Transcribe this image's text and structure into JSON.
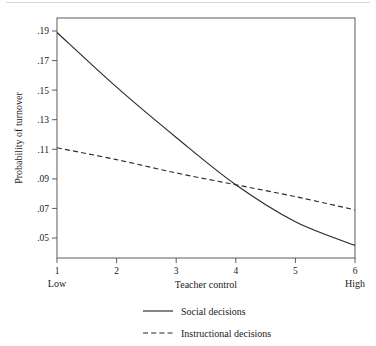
{
  "chart_data": {
    "type": "line",
    "title": "",
    "xlabel": "Teacher control",
    "ylabel": "Probability of turnover",
    "xlim": [
      1,
      6
    ],
    "ylim": [
      0.04,
      0.2
    ],
    "grid": false,
    "legend_position": "bottom",
    "x_ticks": [
      "1",
      "2",
      "3",
      "4",
      "5",
      "6"
    ],
    "x_tick_values": [
      1,
      2,
      3,
      4,
      5,
      6
    ],
    "x_axis_low_label": "Low",
    "x_axis_high_label": "High",
    "y_ticks": [
      ".19",
      ".17",
      ".15",
      ".13",
      ".11",
      ".09",
      ".07",
      ".05"
    ],
    "y_tick_values": [
      0.19,
      0.17,
      0.15,
      0.13,
      0.11,
      0.09,
      0.07,
      0.05
    ],
    "x": [
      1,
      2,
      3,
      4,
      5,
      6
    ],
    "series": [
      {
        "name": "Social decisions",
        "style": "solid",
        "color": "#2b2b2b",
        "values": [
          0.189,
          0.152,
          0.118,
          0.086,
          0.061,
          0.045
        ]
      },
      {
        "name": "Instructional decisions",
        "style": "dashed",
        "color": "#2b2b2b",
        "values": [
          0.111,
          0.103,
          0.094,
          0.086,
          0.078,
          0.069
        ]
      }
    ],
    "annotations": [
      "Curves cross near Teacher control = 3.75 at probability = .088"
    ]
  },
  "legend": {
    "items": [
      {
        "label": "Social decisions",
        "style": "solid"
      },
      {
        "label": "Instructional decisions",
        "style": "dashed"
      }
    ]
  },
  "axes": {
    "y_title": "Probability of turnover",
    "x_title": "Teacher control"
  },
  "colors": {
    "line": "#2b2b2b",
    "axis": "#4a4a4a",
    "background": "#ffffff",
    "top_rule": "#d8d8d8"
  }
}
